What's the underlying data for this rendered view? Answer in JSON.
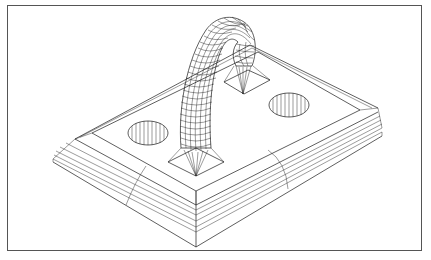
{
  "figure": {
    "line_color": "#1a1a1a",
    "background": "#ffffff",
    "frame_color": "#555555"
  },
  "parts": [
    {
      "name": "base-plate",
      "label": ""
    },
    {
      "name": "left-hole",
      "label": ""
    },
    {
      "name": "right-hole",
      "label": ""
    },
    {
      "name": "handle",
      "label": ""
    },
    {
      "name": "front-boss",
      "label": ""
    },
    {
      "name": "rear-boss",
      "label": ""
    }
  ]
}
